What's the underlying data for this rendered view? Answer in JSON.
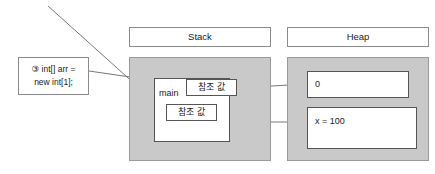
{
  "diagram": {
    "background": "#ffffff",
    "panel_fill": "#c9c9c9",
    "box_fill": "#ffffff",
    "line_color": "#555555"
  },
  "headers": {
    "stack": "Stack",
    "heap": "Heap"
  },
  "code_note": {
    "line1": "③ int[] arr =",
    "line2": "new int[1];"
  },
  "stack": {
    "frame_label": "main",
    "slots": [
      {
        "label": "참조 값"
      },
      {
        "label": "참조 값"
      }
    ]
  },
  "heap": {
    "objects": [
      {
        "label": "0"
      },
      {
        "label": "x = 100"
      }
    ]
  }
}
